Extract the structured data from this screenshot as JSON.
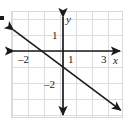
{
  "chart_data": {
    "type": "line",
    "title": "",
    "xlabel": "x",
    "ylabel": "y",
    "xlim": [
      -3.25,
      3.9
    ],
    "ylim": [
      -4.25,
      2.45
    ],
    "grid": true,
    "grid_step": 1,
    "legend": "none",
    "x_tick_labels": [
      "–2",
      "1",
      "3"
    ],
    "x_tick_values": [
      -2,
      1,
      3
    ],
    "y_tick_labels": [
      "1",
      "–2"
    ],
    "y_tick_values": [
      1,
      -2
    ],
    "series": [
      {
        "name": "line",
        "equation": "y = -3/4 x - 1",
        "slope": -0.75,
        "intercept": -1,
        "arrows": "both",
        "x": [
          -3.1,
          3.6
        ],
        "y": [
          1.33,
          -3.7
        ]
      }
    ],
    "annotations": []
  },
  "figure": {
    "axis_x_name": "x",
    "axis_y_name": "y",
    "marker": "▪",
    "colors": {
      "ink": "#1a1a1a",
      "grid": "#dddde1",
      "border": "#d9d9dd",
      "background": "#ffffff"
    }
  },
  "labels": {
    "x_neg2": "–2",
    "x_pos1": "1",
    "x_pos3": "3",
    "y_pos1": "1",
    "y_neg2": "–2",
    "x_axis": "x",
    "y_axis": "y"
  }
}
